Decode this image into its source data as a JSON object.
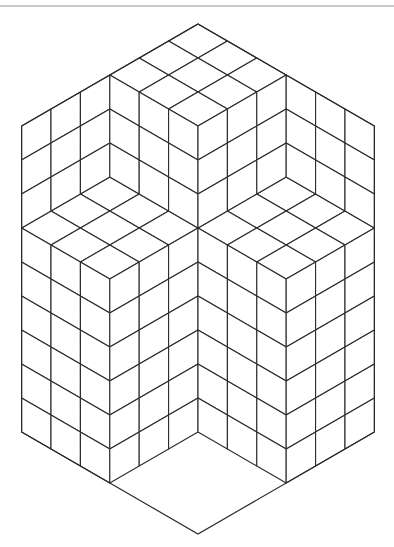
{
  "figure": {
    "line_color": "#2b2b2b",
    "background": "#ffffff",
    "top_rule_color": "#c8c8c8",
    "origin": {
      "x": 198,
      "y": 24
    },
    "unit": {
      "dx": 29.4,
      "dy": 17
    },
    "hexagon": [
      [
        0,
        0
      ],
      [
        6,
        6
      ],
      [
        6,
        24
      ],
      [
        0,
        30
      ],
      [
        -6,
        24
      ],
      [
        -6,
        6
      ]
    ],
    "regions": [
      {
        "name": "top-cap",
        "type": "T",
        "a0": 0,
        "b0": 0,
        "ni": 3,
        "nj": 3
      },
      {
        "name": "upper-left-floor",
        "type": "T",
        "a0": -3,
        "b0": 9,
        "ni": 3,
        "nj": 3
      },
      {
        "name": "upper-right-floor",
        "type": "T",
        "a0": 3,
        "b0": 9,
        "ni": 3,
        "nj": 3
      },
      {
        "name": "lower-floor",
        "type": "T",
        "a0": 0,
        "b0": 18,
        "ni": 3,
        "nj": 3
      },
      {
        "name": "upper-left-back-wall",
        "type": "R",
        "a0": -6,
        "b0": 6,
        "cols": 3,
        "rows": 3
      },
      {
        "name": "upper-left-side-wall",
        "type": "L",
        "a0": -3,
        "b0": 3,
        "cols": 3,
        "rows": 3
      },
      {
        "name": "upper-right-side-wall",
        "type": "R",
        "a0": 0,
        "b0": 6,
        "cols": 3,
        "rows": 3
      },
      {
        "name": "upper-right-back-wall",
        "type": "L",
        "a0": 3,
        "b0": 3,
        "cols": 3,
        "rows": 3
      },
      {
        "name": "left-lower-wall-left",
        "type": "L",
        "a0": -6,
        "b0": 12,
        "cols": 3,
        "rows": 6
      },
      {
        "name": "left-lower-wall-right",
        "type": "R",
        "a0": -3,
        "b0": 15,
        "cols": 3,
        "rows": 6
      },
      {
        "name": "right-lower-wall-left",
        "type": "L",
        "a0": 0,
        "b0": 12,
        "cols": 3,
        "rows": 6
      },
      {
        "name": "right-lower-wall-right",
        "type": "R",
        "a0": 3,
        "b0": 15,
        "cols": 3,
        "rows": 6
      }
    ]
  }
}
